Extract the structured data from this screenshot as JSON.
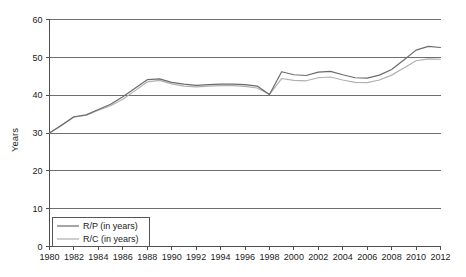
{
  "chart_data": {
    "type": "line",
    "title": "",
    "xlabel": "",
    "ylabel": "Years",
    "xlim": [
      1980,
      2012
    ],
    "ylim": [
      0,
      60
    ],
    "grid": true,
    "legend_position": "bottom-left",
    "xticks": [
      1980,
      1982,
      1984,
      1986,
      1988,
      1990,
      1992,
      1994,
      1996,
      1998,
      2000,
      2002,
      2004,
      2006,
      2008,
      2010,
      2012
    ],
    "yticks": [
      0,
      10,
      20,
      30,
      40,
      50,
      60
    ],
    "x": [
      1980,
      1981,
      1982,
      1983,
      1984,
      1985,
      1986,
      1987,
      1988,
      1989,
      1990,
      1991,
      1992,
      1993,
      1994,
      1995,
      1996,
      1997,
      1998,
      1999,
      2000,
      2001,
      2002,
      2003,
      2004,
      2005,
      2006,
      2007,
      2008,
      2009,
      2010,
      2011,
      2012
    ],
    "series": [
      {
        "name": "R/P (in years)",
        "color": "#6b6b6b",
        "values": [
          30.0,
          32.1,
          34.3,
          34.8,
          36.2,
          37.6,
          39.6,
          41.8,
          44.1,
          44.3,
          43.4,
          42.9,
          42.6,
          42.8,
          42.9,
          42.9,
          42.8,
          42.4,
          40.2,
          46.2,
          45.4,
          45.2,
          46.1,
          46.3,
          45.4,
          44.6,
          44.5,
          45.3,
          46.8,
          49.3,
          51.9,
          52.9,
          52.6
        ]
      },
      {
        "name": "R/C (in years)",
        "color": "#b0b0b0",
        "values": [
          30.0,
          32.0,
          34.2,
          34.7,
          36.0,
          37.2,
          38.9,
          41.2,
          43.5,
          43.9,
          43.0,
          42.4,
          42.2,
          42.4,
          42.5,
          42.5,
          42.3,
          41.9,
          40.2,
          44.4,
          43.9,
          43.8,
          44.6,
          44.8,
          44.0,
          43.4,
          43.3,
          44.0,
          45.3,
          47.2,
          49.1,
          49.6,
          49.5
        ]
      }
    ]
  },
  "legend": {
    "entries": [
      {
        "label": "R/P (in years)"
      },
      {
        "label": "R/C (in years)"
      }
    ]
  },
  "axes": {
    "y_title": "Years"
  }
}
